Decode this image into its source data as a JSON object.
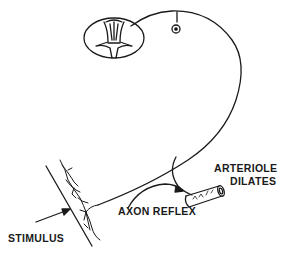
{
  "diagram": {
    "type": "axon-reflex-schematic",
    "labels": {
      "stimulus": "STIMULUS",
      "axon_reflex": "AXON REFLEX",
      "arteriole_line1": "ARTERIOLE",
      "arteriole_line2": "DILATES"
    },
    "elements": [
      "spinal-cord-cross-section",
      "dorsal-root-ganglion-cell-body",
      "sensory-nerve-fiber",
      "skin-surface",
      "sensory-nerve-endings",
      "axon-collateral-branch",
      "arteriole"
    ],
    "colors": {
      "line": "#1a1a1a",
      "background": "#ffffff"
    }
  }
}
